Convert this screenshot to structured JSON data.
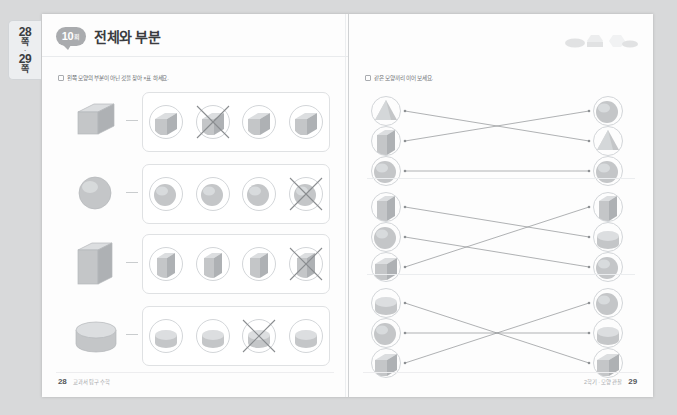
{
  "document": {
    "type": "workbook-spread",
    "side_tab": {
      "page_from": "28",
      "page_to": "29",
      "unit": "쪽",
      "separator": "·"
    }
  },
  "left_page": {
    "badge": {
      "number": "10",
      "unit": "회"
    },
    "title": "전체와 부분",
    "instruction": "왼쪽 모양의 부분이 아닌 것을 찾아 ×표 하세요.",
    "exercises": [
      {
        "key_shape": "cube",
        "options": [
          "cube-part-a",
          "cube-part-b",
          "cube-part-c",
          "cube-part-d"
        ],
        "crossed_index": 1
      },
      {
        "key_shape": "sphere",
        "options": [
          "sphere-part-a",
          "sphere-part-b",
          "sphere-part-c",
          "sphere-part-d"
        ],
        "crossed_index": 3
      },
      {
        "key_shape": "prism",
        "options": [
          "prism-part-a",
          "prism-part-b",
          "prism-part-c",
          "prism-part-d"
        ],
        "crossed_index": 3
      },
      {
        "key_shape": "cylinder",
        "options": [
          "cylinder-part-a",
          "cylinder-part-b",
          "cylinder-part-c",
          "cylinder-part-d"
        ],
        "crossed_index": 2
      }
    ],
    "footer": {
      "page_number": "28",
      "note": "교과서 탐구 수학"
    }
  },
  "right_page": {
    "instruction": "같은 모양끼리 이어 보세요.",
    "match_groups": [
      {
        "left_items": [
          "cone-part",
          "prism-part",
          "sphere-part"
        ],
        "right_items": [
          "sphere-part",
          "cone-part",
          "sphere-part"
        ],
        "connections": [
          {
            "from": 0,
            "to": 1
          },
          {
            "from": 1,
            "to": 0
          },
          {
            "from": 2,
            "to": 2
          }
        ]
      },
      {
        "left_items": [
          "prism-part",
          "sphere-part",
          "cube-part"
        ],
        "right_items": [
          "prism-part",
          "cylinder-part",
          "sphere-part"
        ],
        "connections": [
          {
            "from": 0,
            "to": 1
          },
          {
            "from": 1,
            "to": 2
          },
          {
            "from": 2,
            "to": 0
          }
        ]
      },
      {
        "left_items": [
          "cylinder-part",
          "sphere-part",
          "cube-part"
        ],
        "right_items": [
          "sphere-part",
          "cylinder-part",
          "cube-part"
        ],
        "connections": [
          {
            "from": 0,
            "to": 2
          },
          {
            "from": 1,
            "to": 1
          },
          {
            "from": 2,
            "to": 0
          }
        ]
      }
    ],
    "footer": {
      "page_number": "29",
      "note": "2학기 · 모양 관찰"
    }
  },
  "colors": {
    "page_background": "#fdfdfd",
    "scan_background": "#d8d9da",
    "badge": "#a9abae",
    "title_text": "#3a3c3f",
    "instruction_text": "#6e7175",
    "rule": "#e9ebed",
    "shape_fill": "#c9cbcd",
    "shape_stroke": "#b4b7ba",
    "line": "#8e9194",
    "x_mark": "#8a8d90"
  }
}
